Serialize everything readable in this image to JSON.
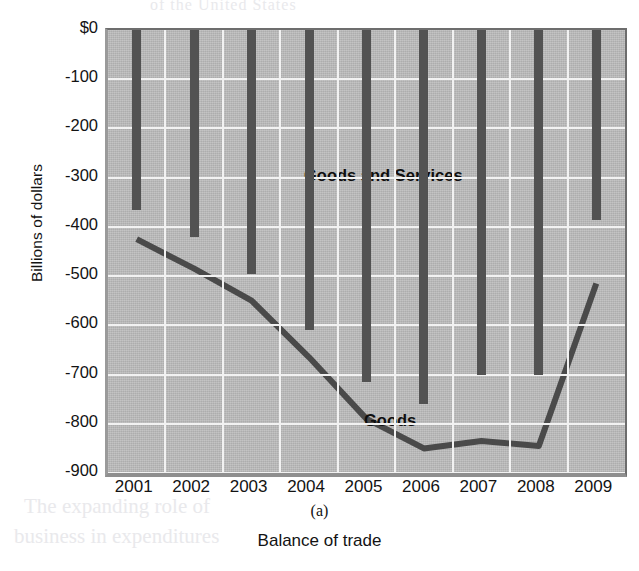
{
  "figure": {
    "panel_letter": "(a)",
    "caption": "Balance of trade",
    "ylabel": "Billions of dollars"
  },
  "bleed_through": {
    "top": "of the United States",
    "bottom_line1": "The expanding role of",
    "bottom_line2": "business in expenditures",
    "right": "the exchange rate"
  },
  "series_labels": {
    "goods_and_services": "Goods and Services",
    "goods": "Goods"
  },
  "colors": {
    "plot_background": "#b9b9b9",
    "gridline": "#f2f2f2",
    "bar": "#525252",
    "line": "#4a4a4a",
    "text": "#131313"
  },
  "chart_data": {
    "type": "bar",
    "title": "",
    "xlabel": "Balance of trade",
    "ylabel": "Billions of dollars",
    "categories": [
      "2001",
      "2002",
      "2003",
      "2004",
      "2005",
      "2006",
      "2007",
      "2008",
      "2009"
    ],
    "ylim": [
      -900,
      0
    ],
    "ytick_labels": [
      "$0",
      "-100",
      "-200",
      "-300",
      "-400",
      "-500",
      "-600",
      "-700",
      "-800",
      "-900"
    ],
    "ytick_values": [
      0,
      -100,
      -200,
      -300,
      -400,
      -500,
      -600,
      -700,
      -800,
      -900
    ],
    "grid": true,
    "legend": "in-plot labels",
    "series": [
      {
        "name": "Goods and Services",
        "render": "bar",
        "values": [
          -365,
          -420,
          -495,
          -610,
          -715,
          -760,
          -700,
          -700,
          -385
        ]
      },
      {
        "name": "Goods",
        "render": "line",
        "values": [
          -425,
          -485,
          -550,
          -665,
          -790,
          -850,
          -835,
          -845,
          -515
        ]
      }
    ]
  }
}
